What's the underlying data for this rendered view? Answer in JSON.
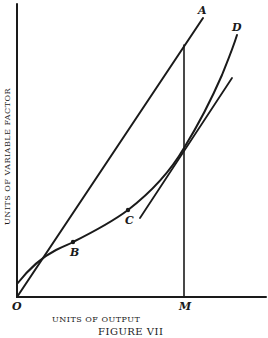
{
  "figure": {
    "caption": "FIGURE VII",
    "x_axis_label": "UNITS OF OUTPUT",
    "y_axis_label": "UNITS OF VARIABLE FACTOR",
    "origin_label": "O",
    "point_labels": {
      "A": "A",
      "B": "B",
      "C": "C",
      "D": "D",
      "M": "M"
    },
    "elements": [
      {
        "name": "ray-OA",
        "type": "straight line from origin through A"
      },
      {
        "name": "curve-D",
        "type": "total variable factor curve passing B and C to D"
      },
      {
        "name": "tangent-at-curve",
        "type": "straight line tangent to curve near M"
      },
      {
        "name": "vertical-M",
        "type": "vertical line at output M"
      }
    ],
    "colors": {
      "ink": "#1a1a1a",
      "background": "#ffffff"
    }
  }
}
